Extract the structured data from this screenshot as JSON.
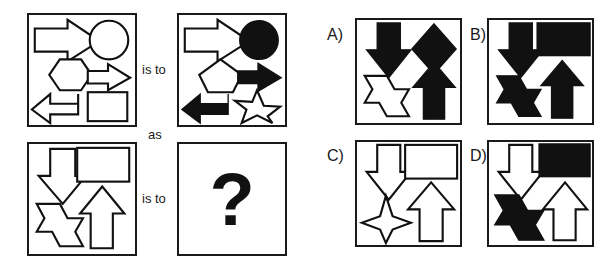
{
  "puzzle": {
    "type": "visual-analogy-matrix",
    "relation_labels": {
      "is_to_top": "is to",
      "as": "as",
      "is_to_bottom": "is to"
    },
    "missing_marker": "?",
    "matrix": [
      {
        "position": "top-left",
        "name": "panel-a1",
        "shapes": [
          {
            "shape": "right-arrow",
            "size": "large",
            "fill": "white"
          },
          {
            "shape": "circle",
            "size": "medium",
            "fill": "white"
          },
          {
            "shape": "hexagon",
            "size": "medium",
            "fill": "white"
          },
          {
            "shape": "right-arrow",
            "size": "small",
            "fill": "white"
          },
          {
            "shape": "left-arrow",
            "size": "medium",
            "fill": "white"
          },
          {
            "shape": "square",
            "size": "medium",
            "fill": "white"
          }
        ]
      },
      {
        "position": "top-right",
        "name": "panel-a2",
        "shapes": [
          {
            "shape": "right-arrow",
            "size": "large",
            "fill": "white"
          },
          {
            "shape": "circle",
            "size": "medium",
            "fill": "black"
          },
          {
            "shape": "pentagon",
            "size": "medium",
            "fill": "white"
          },
          {
            "shape": "right-arrow",
            "size": "small",
            "fill": "black"
          },
          {
            "shape": "left-arrow",
            "size": "medium",
            "fill": "black"
          },
          {
            "shape": "star-5",
            "size": "medium",
            "fill": "white"
          }
        ]
      },
      {
        "position": "bottom-left",
        "name": "panel-b1",
        "shapes": [
          {
            "shape": "down-arrow",
            "size": "large",
            "fill": "white"
          },
          {
            "shape": "rectangle",
            "size": "medium",
            "fill": "white"
          },
          {
            "shape": "star-6",
            "size": "medium",
            "fill": "white"
          },
          {
            "shape": "up-arrow",
            "size": "medium",
            "fill": "white"
          }
        ]
      },
      {
        "position": "bottom-right",
        "name": "panel-b2",
        "shapes": [],
        "content": "?"
      }
    ],
    "options": [
      {
        "id": "A",
        "label": "A)",
        "shapes": [
          {
            "shape": "down-arrow",
            "size": "large",
            "fill": "black"
          },
          {
            "shape": "diamond",
            "size": "medium",
            "fill": "black"
          },
          {
            "shape": "star-6",
            "size": "medium",
            "fill": "white"
          },
          {
            "shape": "up-arrow",
            "size": "medium",
            "fill": "black"
          }
        ]
      },
      {
        "id": "B",
        "label": "B)",
        "shapes": [
          {
            "shape": "down-arrow",
            "size": "large",
            "fill": "black"
          },
          {
            "shape": "rectangle",
            "size": "medium",
            "fill": "black"
          },
          {
            "shape": "star-6",
            "size": "medium",
            "fill": "black"
          },
          {
            "shape": "up-arrow",
            "size": "medium",
            "fill": "black"
          }
        ]
      },
      {
        "id": "C",
        "label": "C)",
        "shapes": [
          {
            "shape": "down-arrow",
            "size": "large",
            "fill": "white"
          },
          {
            "shape": "rectangle",
            "size": "medium",
            "fill": "white"
          },
          {
            "shape": "star-4",
            "size": "medium",
            "fill": "white"
          },
          {
            "shape": "up-arrow",
            "size": "medium",
            "fill": "white"
          }
        ]
      },
      {
        "id": "D",
        "label": "D)",
        "shapes": [
          {
            "shape": "down-arrow",
            "size": "large",
            "fill": "white"
          },
          {
            "shape": "rectangle",
            "size": "medium",
            "fill": "black"
          },
          {
            "shape": "star-6",
            "size": "medium",
            "fill": "black"
          },
          {
            "shape": "up-arrow",
            "size": "medium",
            "fill": "white"
          }
        ]
      }
    ]
  },
  "colors": {
    "ink": "#111111",
    "paper": "#ffffff",
    "border": "#1a1a1a"
  }
}
